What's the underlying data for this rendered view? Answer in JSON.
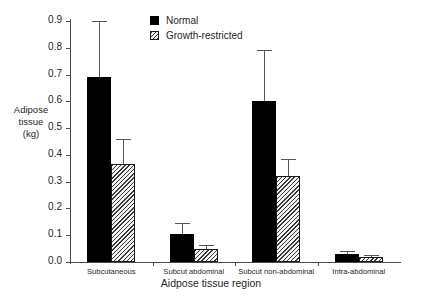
{
  "chart_data": {
    "type": "bar",
    "title": "",
    "xlabel": "Aidpose tissue region",
    "ylabel": "Adipose tissue (kg)",
    "ylabel_lines": [
      "Adipose",
      "tissue",
      "(kg)"
    ],
    "categories": [
      "Subcutaneous",
      "Subcut abdominal",
      "Subcut non-abdominal",
      "Intra-abdominal"
    ],
    "ylim": [
      0.0,
      0.9
    ],
    "ytick_labels": [
      "0.0",
      "0.1",
      "0.2",
      "0.3",
      "0.4",
      "0.5",
      "0.6",
      "0.7",
      "0.8",
      "0.9"
    ],
    "ytick_values": [
      0.0,
      0.1,
      0.2,
      0.3,
      0.4,
      0.5,
      0.6,
      0.7,
      0.8,
      0.9
    ],
    "grid": false,
    "legend_position": "top-center",
    "series": [
      {
        "name": "Normal",
        "fill": "solid-black",
        "color": "#000000",
        "values": [
          0.69,
          0.105,
          0.6,
          0.03
        ],
        "error_high": [
          0.9,
          0.145,
          0.79,
          0.042
        ]
      },
      {
        "name": "Growth-restricted",
        "fill": "hatched",
        "color": "#3a3a3a",
        "values": [
          0.365,
          0.05,
          0.32,
          0.02
        ],
        "error_high": [
          0.46,
          0.065,
          0.385,
          0.027
        ]
      }
    ]
  },
  "legend": {
    "items": [
      {
        "label": "Normal",
        "style": "normal"
      },
      {
        "label": "Growth-restricted",
        "style": "restricted"
      }
    ]
  }
}
